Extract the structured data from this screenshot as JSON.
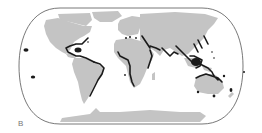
{
  "figure": {
    "panel_label": "B",
    "projection": "Robinson-style world map",
    "colors": {
      "land": "#c4c4c4",
      "ocean": "#ffffff",
      "border": "#555555",
      "highlight": "#1a1a1a",
      "label": "#777777"
    },
    "highlighted_regions": [
      "Caribbean / Gulf of Mexico",
      "Brazil Atlantic coast",
      "Hawaii",
      "French Polynesia",
      "Red Sea",
      "West Africa coast",
      "East Africa coast",
      "Arabian Sea / Persian Gulf coast",
      "India coasts",
      "Southeast Asia / Coral Triangle",
      "Japan / Ryukyu",
      "Micronesia",
      "Northern Australia",
      "Southern Australia",
      "New Zealand / Melanesia",
      "Mediterranean points"
    ]
  }
}
